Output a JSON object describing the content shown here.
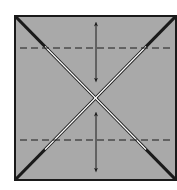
{
  "diagram": {
    "type": "origami-fold-step",
    "colors": {
      "paper": "#a9a9a9",
      "edge": "#1a1a1a",
      "crease_highlight": "#ffffff",
      "background": "#ffffff"
    },
    "square": {
      "x": 15,
      "y": 16,
      "w": 161,
      "h": 164
    },
    "diagonals": 2,
    "dashed_lines": [
      {
        "name": "upper-valley-fold",
        "y": 48
      },
      {
        "name": "lower-valley-fold",
        "y": 140
      }
    ],
    "arrows": [
      {
        "name": "upper-double-arrow",
        "x": 96,
        "y1": 22,
        "y2": 82
      },
      {
        "name": "lower-double-arrow",
        "x": 96,
        "y1": 112,
        "y2": 172
      }
    ]
  }
}
